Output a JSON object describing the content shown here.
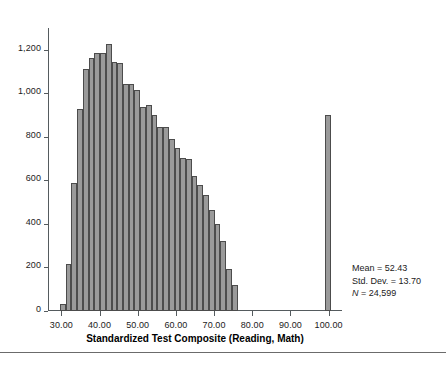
{
  "chart_data": {
    "type": "bar",
    "title": "",
    "xlabel": "Standardized Test Composite (Reading, Math)",
    "ylabel": "",
    "xlim": [
      26.5,
      103.5
    ],
    "ylim": [
      0,
      1300
    ],
    "grid": false,
    "legend": "none",
    "bin_width": 1.5,
    "bar_color": "#9a9a9a",
    "bar_edge_color": "#4c4c4c",
    "yticks": [
      0,
      200,
      400,
      600,
      800,
      1000,
      1200
    ],
    "ytick_labels": [
      "0",
      "200",
      "400",
      "600",
      "800",
      "1,000",
      "1,200"
    ],
    "xticks": [
      30,
      40,
      50,
      60,
      70,
      80,
      90,
      100
    ],
    "xtick_labels": [
      "30.00",
      "40.00",
      "50.00",
      "60.00",
      "70.00",
      "80.00",
      "90.00",
      "100.00"
    ],
    "x": [
      30.4,
      31.9,
      33.4,
      34.9,
      36.4,
      37.9,
      39.4,
      40.9,
      42.4,
      43.9,
      45.4,
      46.9,
      48.4,
      49.9,
      51.4,
      52.9,
      54.4,
      55.9,
      57.4,
      58.9,
      60.4,
      61.9,
      63.4,
      64.9,
      66.4,
      67.9,
      69.4,
      70.9,
      72.4,
      73.9,
      75.4,
      99.8
    ],
    "values": [
      30,
      215,
      590,
      930,
      1110,
      1160,
      1185,
      1185,
      1225,
      1145,
      1140,
      1045,
      1045,
      1015,
      935,
      945,
      900,
      845,
      845,
      790,
      750,
      705,
      700,
      620,
      580,
      535,
      465,
      400,
      320,
      195,
      120,
      900
    ],
    "annotations": [
      "Mean = 52.43",
      "Std. Dev. = 13.70",
      "N = 24,599"
    ]
  },
  "axes": {
    "x_title": "Standardized Test Composite (Reading, Math)"
  },
  "stats": {
    "mean_label": "Mean = 52.43",
    "stddev_label": "Std. Dev. = 13.70",
    "n_symbol": "N",
    "n_value": " = 24,599"
  },
  "caption": {
    "text": ""
  }
}
